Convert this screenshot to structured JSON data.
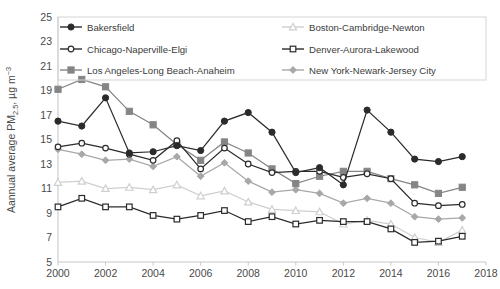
{
  "chart_data": {
    "type": "line",
    "title": "",
    "xlabel": "",
    "ylabel": "Aannual average PM2.5, µg m-3",
    "ylabel_parts": {
      "prefix": "Aannual average PM",
      "subscript": "2.5",
      "middle": ", µg m",
      "superscript": "−3"
    },
    "x": [
      2000,
      2001,
      2002,
      2003,
      2004,
      2005,
      2006,
      2007,
      2008,
      2009,
      2010,
      2011,
      2012,
      2013,
      2014,
      2015,
      2016,
      2017
    ],
    "xlim": [
      2000,
      2018
    ],
    "ylim": [
      5,
      25
    ],
    "xticks": [
      2000,
      2002,
      2004,
      2006,
      2008,
      2010,
      2012,
      2014,
      2016,
      2018
    ],
    "yticks": [
      5,
      7,
      9,
      11,
      13,
      15,
      17,
      19,
      21,
      23,
      25
    ],
    "grid": false,
    "legend_position": "top-inside-two-columns",
    "series": [
      {
        "name": "Bakersfield",
        "marker": "filled-circle",
        "color": "#2b2b2b",
        "values": [
          16.5,
          16.1,
          18.4,
          13.9,
          14.0,
          14.5,
          14.1,
          16.5,
          17.2,
          15.6,
          12.3,
          12.7,
          11.3,
          17.4,
          15.6,
          13.4,
          13.2,
          13.6
        ]
      },
      {
        "name": "Chicago-Naperville-Elgi",
        "marker": "open-circle",
        "color": "#2b2b2b",
        "values": [
          14.4,
          14.7,
          14.3,
          13.8,
          13.3,
          14.9,
          12.6,
          14.3,
          13.0,
          12.3,
          12.4,
          12.4,
          11.9,
          12.2,
          11.8,
          9.8,
          9.6,
          9.7
        ]
      },
      {
        "name": "Los Angeles-Long Beach-Anaheim",
        "marker": "filled-square",
        "color": "#858585",
        "values": [
          19.1,
          19.9,
          19.3,
          17.3,
          16.2,
          14.6,
          13.3,
          14.8,
          13.9,
          12.6,
          11.4,
          12.0,
          12.4,
          12.4,
          11.8,
          11.3,
          10.6,
          11.1
        ]
      },
      {
        "name": "Boston-Cambridge-Newton",
        "marker": "open-triangle",
        "color": "#cfcfcf",
        "values": [
          11.5,
          11.6,
          11.0,
          11.1,
          10.9,
          11.3,
          10.4,
          10.8,
          9.9,
          9.3,
          9.2,
          9.1,
          8.1,
          8.4,
          8.1,
          7.0,
          6.6,
          7.6
        ]
      },
      {
        "name": "Denver-Aurora-Lakewood",
        "marker": "open-square",
        "color": "#2b2b2b",
        "values": [
          9.5,
          10.2,
          9.5,
          9.5,
          8.8,
          8.5,
          8.8,
          9.2,
          8.3,
          8.7,
          8.1,
          8.4,
          8.3,
          8.3,
          7.7,
          6.6,
          6.7,
          7.1
        ]
      },
      {
        "name": "New York-Newark-Jersey City",
        "marker": "filled-diamond",
        "color": "#a8a8a8",
        "values": [
          14.2,
          13.8,
          13.3,
          13.4,
          12.8,
          13.6,
          12.0,
          13.1,
          11.6,
          10.7,
          10.9,
          10.6,
          9.8,
          10.2,
          9.8,
          8.7,
          8.5,
          8.6
        ]
      }
    ]
  },
  "legend": {
    "entries": [
      {
        "label": "Bakersfield"
      },
      {
        "label": "Chicago-Naperville-Elgi"
      },
      {
        "label": "Los Angeles-Long Beach-Anaheim"
      },
      {
        "label": "Boston-Cambridge-Newton"
      },
      {
        "label": "Denver-Aurora-Lakewood"
      },
      {
        "label": "New York-Newark-Jersey City"
      }
    ]
  }
}
